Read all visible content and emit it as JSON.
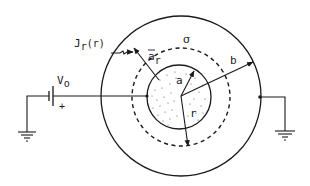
{
  "diagram": {
    "colors": {
      "stroke": "#1a1a1a",
      "background": "#ffffff",
      "dots": "#555555"
    },
    "labels": {
      "current_density": "J",
      "current_density_sub": "r",
      "current_density_arg": "(r)",
      "unit_vector": "a",
      "unit_vector_sub": "r",
      "conductivity": "σ",
      "outer_radius": "b",
      "inner_radius": "a",
      "radial_distance": "r",
      "voltage": "V",
      "voltage_sub": "o",
      "polarity": "+"
    },
    "geometry": {
      "center": [
        181,
        96
      ],
      "outer_radius_px": 80,
      "gaussian_radius_px": 49,
      "inner_radius_px": 32
    }
  }
}
